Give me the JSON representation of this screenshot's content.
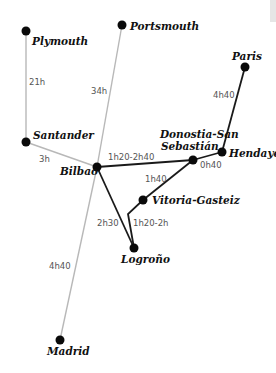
{
  "colors": {
    "city_dot": "#0a0a0a",
    "rail_route": "#1a1a1a",
    "ferry_route": "#b8b8b8",
    "time_text": "#555555"
  },
  "cities": {
    "plymouth": {
      "name": "Plymouth",
      "x": 26,
      "y": 31
    },
    "portsmouth": {
      "name": "Portsmouth",
      "x": 122,
      "y": 25
    },
    "paris": {
      "name": "Paris",
      "x": 245,
      "y": 67
    },
    "santander": {
      "name": "Santander",
      "x": 26,
      "y": 142
    },
    "bilbao": {
      "name": "Bilbao",
      "x": 97,
      "y": 167
    },
    "donostia": {
      "name_line1": "Donostia-San",
      "name_line2": "Sebastián",
      "x": 193,
      "y": 160
    },
    "hendaye": {
      "name": "Hendaye",
      "x": 222,
      "y": 152
    },
    "vitoria": {
      "name": "Vitoria-Gasteiz",
      "x": 143,
      "y": 200
    },
    "logrono": {
      "name": "Logroño",
      "x": 134,
      "y": 248
    },
    "madrid": {
      "name": "Madrid",
      "x": 60,
      "y": 340
    }
  },
  "routes": [
    {
      "from": "Plymouth",
      "to": "Santander",
      "time": "21h",
      "type": "ferry"
    },
    {
      "from": "Portsmouth",
      "to": "Bilbao",
      "time": "34h",
      "type": "ferry"
    },
    {
      "from": "Santander",
      "to": "Bilbao",
      "time": "3h",
      "type": "ferry"
    },
    {
      "from": "Bilbao",
      "to": "Madrid",
      "time": "4h40",
      "type": "ferry"
    },
    {
      "from": "Bilbao",
      "to": "Donostia-San Sebastián",
      "time": "1h20-2h40",
      "type": "rail"
    },
    {
      "from": "Donostia-San Sebastián",
      "to": "Hendaye",
      "time": "0h40",
      "type": "rail"
    },
    {
      "from": "Hendaye",
      "to": "Paris",
      "time": "4h40",
      "type": "rail"
    },
    {
      "from": "Donostia-San Sebastián",
      "to": "Vitoria-Gasteiz",
      "time": "1h40",
      "type": "rail"
    },
    {
      "from": "Bilbao",
      "to": "Logroño",
      "time": "2h30",
      "type": "rail"
    },
    {
      "from": "Vitoria-Gasteiz",
      "to": "Logroño",
      "time": "1h20-2h",
      "type": "rail"
    }
  ],
  "labels": {
    "plymouth": "Plymouth",
    "portsmouth": "Portsmouth",
    "paris": "Paris",
    "santander": "Santander",
    "bilbao": "Bilbao",
    "donostia_1": "Donostia-San",
    "donostia_2": "Sebastián",
    "hendaye": "Hendaye",
    "vitoria": "Vitoria-Gasteiz",
    "logrono": "Logroño",
    "madrid": "Madrid",
    "t_plymouth_santander": "21h",
    "t_portsmouth_bilbao": "34h",
    "t_santander_bilbao": "3h",
    "t_bilbao_madrid": "4h40",
    "t_bilbao_donostia": "1h20-2h40",
    "t_donostia_hendaye": "0h40",
    "t_hendaye_paris": "4h40",
    "t_donostia_vitoria": "1h40",
    "t_bilbao_logrono": "2h30",
    "t_vitoria_logrono": "1h20-2h"
  }
}
